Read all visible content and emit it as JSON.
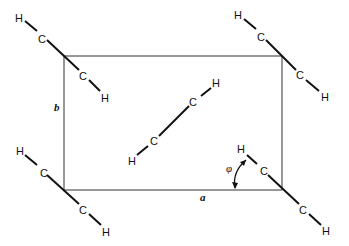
{
  "figure": {
    "cell": {
      "label_a": "a",
      "label_b": "b",
      "angle_label": "φ"
    },
    "atoms": {
      "carbon": "C",
      "hydrogen": "H"
    },
    "molecules": [
      {
        "id": "corner-top-left",
        "atoms": [
          "H",
          "C",
          "C",
          "H"
        ]
      },
      {
        "id": "corner-top-right",
        "atoms": [
          "H",
          "C",
          "C",
          "H"
        ]
      },
      {
        "id": "corner-bottom-left",
        "atoms": [
          "H",
          "C",
          "C",
          "H"
        ]
      },
      {
        "id": "corner-bottom-right",
        "atoms": [
          "H",
          "C",
          "C",
          "H"
        ]
      },
      {
        "id": "center",
        "atoms": [
          "H",
          "C",
          "C",
          "H"
        ]
      }
    ]
  }
}
